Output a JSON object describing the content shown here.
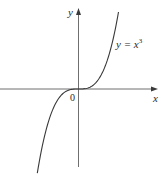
{
  "chart_data": {
    "type": "line",
    "title": "",
    "function": "y = x^3",
    "series": [
      {
        "name": "y = x³",
        "formula": "x^3",
        "x_range": [
          -1.03,
          1.0
        ]
      }
    ],
    "xlabel": "x",
    "ylabel": "y",
    "origin_label": "0",
    "curve_label": {
      "prefix": "y = x",
      "exponent": "3"
    },
    "grid": false,
    "legend": "none",
    "axes": {
      "arrows": true,
      "ticks": false
    },
    "colors": {
      "axis": "#4a4a4a",
      "curve": "#3a3a3a",
      "text": "#2a2a2a"
    }
  }
}
